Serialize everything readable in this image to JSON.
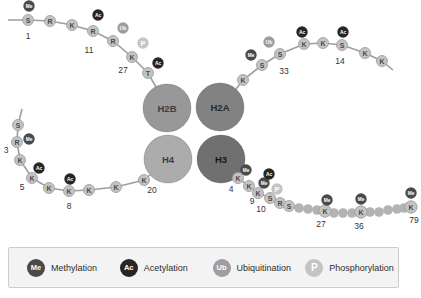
{
  "colors": {
    "background": "#ffffff",
    "line": "#9e9e9e",
    "bead_fill": "#c3c3c3",
    "bead_border": "#999999",
    "bead_text": "#4a4a4a",
    "plain_bead": "#b3b3b3",
    "number_text": "#333333",
    "me": "#4a4a4a",
    "ac": "#262626",
    "ub": "#9e9e9e",
    "p": "#c4c4c4",
    "badge_text": "#ffffff",
    "legend_bg": "#f3f3f3",
    "legend_border": "#cccccc",
    "legend_text": "#2e2e2e"
  },
  "histones": [
    {
      "label": "H2B",
      "x": 167,
      "y": 108,
      "r": 24,
      "color": "#989898",
      "text_color": "#3c3c3c"
    },
    {
      "label": "H2A",
      "x": 220,
      "y": 107,
      "r": 24,
      "color": "#828282",
      "text_color": "#2a2a2a"
    },
    {
      "label": "H4",
      "x": 168,
      "y": 159,
      "r": 24,
      "color": "#acacac",
      "text_color": "#3c3c3c"
    },
    {
      "label": "H3",
      "x": 221,
      "y": 159,
      "r": 24,
      "color": "#707070",
      "text_color": "#161616"
    }
  ],
  "tails": [
    {
      "id": "h2b-tail",
      "line": [
        [
          8,
          20
        ],
        [
          28,
          20
        ],
        [
          50,
          21
        ],
        [
          72,
          25
        ],
        [
          93,
          31
        ],
        [
          113,
          41
        ],
        [
          132,
          57
        ],
        [
          148,
          73
        ],
        [
          156,
          87
        ]
      ],
      "beads": [
        {
          "aa": "S",
          "x": 28,
          "y": 20
        },
        {
          "aa": "R",
          "x": 50,
          "y": 21
        },
        {
          "aa": "K",
          "x": 72,
          "y": 25
        },
        {
          "aa": "R",
          "x": 93,
          "y": 31
        },
        {
          "aa": "R",
          "x": 113,
          "y": 41
        },
        {
          "aa": "K",
          "x": 132,
          "y": 57
        },
        {
          "aa": "T",
          "x": 148,
          "y": 73
        }
      ],
      "plain": [],
      "badges": [
        {
          "t": "Me",
          "x": 29,
          "y": 6
        },
        {
          "t": "Ac",
          "x": 98,
          "y": 15
        },
        {
          "t": "Ub",
          "x": 123,
          "y": 28
        },
        {
          "t": "P",
          "x": 143,
          "y": 43
        },
        {
          "t": "Ac",
          "x": 158,
          "y": 63
        }
      ],
      "nums": [
        {
          "n": "1",
          "x": 28,
          "y": 36
        },
        {
          "n": "11",
          "x": 89,
          "y": 50
        },
        {
          "n": "27",
          "x": 123,
          "y": 70
        }
      ]
    },
    {
      "id": "h2a-tail",
      "line": [
        [
          236,
          89
        ],
        [
          243,
          80
        ],
        [
          262,
          65
        ],
        [
          280,
          54
        ],
        [
          304,
          44
        ],
        [
          323,
          43
        ],
        [
          342,
          45
        ],
        [
          365,
          53
        ],
        [
          382,
          61
        ],
        [
          393,
          70
        ]
      ],
      "beads": [
        {
          "aa": "K",
          "x": 243,
          "y": 80
        },
        {
          "aa": "S",
          "x": 262,
          "y": 65
        },
        {
          "aa": "S",
          "x": 280,
          "y": 54
        },
        {
          "aa": "K",
          "x": 304,
          "y": 44
        },
        {
          "aa": "K",
          "x": 323,
          "y": 43
        },
        {
          "aa": "S",
          "x": 342,
          "y": 45
        },
        {
          "aa": "K",
          "x": 365,
          "y": 53
        },
        {
          "aa": "K",
          "x": 382,
          "y": 61
        }
      ],
      "plain": [],
      "badges": [
        {
          "t": "Me",
          "x": 251,
          "y": 55
        },
        {
          "t": "Ub",
          "x": 269,
          "y": 42
        },
        {
          "t": "Ac",
          "x": 302,
          "y": 32
        },
        {
          "t": "Ac",
          "x": 343,
          "y": 32
        }
      ],
      "nums": [
        {
          "n": "33",
          "x": 284,
          "y": 71
        },
        {
          "n": "14",
          "x": 340,
          "y": 61
        }
      ]
    },
    {
      "id": "h4-tail",
      "line": [
        [
          22,
          109
        ],
        [
          18,
          125
        ],
        [
          17,
          142
        ],
        [
          20,
          160
        ],
        [
          32,
          178
        ],
        [
          49,
          188
        ],
        [
          69,
          191
        ],
        [
          89,
          190
        ],
        [
          116,
          187
        ],
        [
          144,
          180
        ],
        [
          150,
          175
        ]
      ],
      "beads": [
        {
          "aa": "S",
          "x": 18,
          "y": 125
        },
        {
          "aa": "R",
          "x": 17,
          "y": 142
        },
        {
          "aa": "K",
          "x": 20,
          "y": 160
        },
        {
          "aa": "K",
          "x": 32,
          "y": 178
        },
        {
          "aa": "K",
          "x": 49,
          "y": 188
        },
        {
          "aa": "K",
          "x": 69,
          "y": 191
        },
        {
          "aa": "K",
          "x": 89,
          "y": 190
        },
        {
          "aa": "K",
          "x": 116,
          "y": 187
        },
        {
          "aa": "K",
          "x": 144,
          "y": 180
        }
      ],
      "plain": [],
      "badges": [
        {
          "t": "Me",
          "x": 29,
          "y": 139
        },
        {
          "t": "Ac",
          "x": 39,
          "y": 168
        },
        {
          "t": "Ac",
          "x": 70,
          "y": 179
        }
      ],
      "nums": [
        {
          "n": "3",
          "x": 6,
          "y": 150
        },
        {
          "n": "5",
          "x": 22,
          "y": 187
        },
        {
          "n": "8",
          "x": 69,
          "y": 206
        },
        {
          "n": "20",
          "x": 152,
          "y": 190
        }
      ]
    },
    {
      "id": "h3-tail",
      "line": [
        [
          235,
          174
        ],
        [
          238,
          178
        ],
        [
          249,
          186
        ],
        [
          258,
          193
        ],
        [
          270,
          198
        ],
        [
          280,
          203
        ],
        [
          289,
          206
        ],
        [
          299,
          208
        ],
        [
          308,
          209
        ],
        [
          317,
          210
        ],
        [
          325,
          211
        ],
        [
          334,
          213
        ],
        [
          343,
          213
        ],
        [
          352,
          213
        ],
        [
          361,
          212
        ],
        [
          370,
          212
        ],
        [
          379,
          212
        ],
        [
          388,
          210
        ],
        [
          397,
          209
        ],
        [
          404,
          208
        ],
        [
          411,
          207
        ]
      ],
      "beads": [
        {
          "aa": "K",
          "x": 238,
          "y": 178
        },
        {
          "aa": "K",
          "x": 249,
          "y": 186
        },
        {
          "aa": "K",
          "x": 258,
          "y": 193
        },
        {
          "aa": "S",
          "x": 270,
          "y": 198
        },
        {
          "aa": "R",
          "x": 280,
          "y": 203
        },
        {
          "aa": "S",
          "x": 289,
          "y": 206
        },
        {
          "aa": "K",
          "x": 325,
          "y": 211,
          "r": 6.2
        },
        {
          "aa": "K",
          "x": 361,
          "y": 212,
          "r": 6.2
        },
        {
          "aa": "K",
          "x": 411,
          "y": 207,
          "r": 6.2
        }
      ],
      "plain": [
        [
          299,
          208
        ],
        [
          308,
          209
        ],
        [
          317,
          210
        ],
        [
          334,
          213
        ],
        [
          343,
          213
        ],
        [
          352,
          213
        ],
        [
          370,
          212
        ],
        [
          379,
          212
        ],
        [
          388,
          210
        ],
        [
          397,
          209
        ],
        [
          404,
          208
        ]
      ],
      "badges": [
        {
          "t": "Me",
          "x": 246,
          "y": 170
        },
        {
          "t": "Me",
          "x": 264,
          "y": 183
        },
        {
          "t": "Ac",
          "x": 269,
          "y": 174
        },
        {
          "t": "P",
          "x": 277,
          "y": 189
        },
        {
          "t": "Me",
          "x": 327,
          "y": 200
        },
        {
          "t": "Me",
          "x": 361,
          "y": 199
        },
        {
          "t": "Me",
          "x": 411,
          "y": 193
        }
      ],
      "nums": [
        {
          "n": "4",
          "x": 231,
          "y": 189
        },
        {
          "n": "9",
          "x": 252,
          "y": 201
        },
        {
          "n": "10",
          "x": 261,
          "y": 209
        },
        {
          "n": "27",
          "x": 321,
          "y": 224
        },
        {
          "n": "36",
          "x": 359,
          "y": 226
        },
        {
          "n": "79",
          "x": 414,
          "y": 220
        }
      ]
    }
  ],
  "legend": {
    "items": [
      {
        "symbol": "Me",
        "label": "Methylation",
        "color": "#4a4a4a"
      },
      {
        "symbol": "Ac",
        "label": "Acetylation",
        "color": "#262626"
      },
      {
        "symbol": "Ub",
        "label": "Ubiquitination",
        "color": "#9e9e9e"
      },
      {
        "symbol": "P",
        "label": "Phosphorylation",
        "color": "#c4c4c4"
      }
    ]
  }
}
